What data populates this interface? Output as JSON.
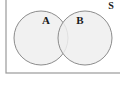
{
  "figure": {
    "type": "venn-diagram",
    "universe": {
      "label": "S",
      "label_x": 111,
      "label_y": 7,
      "rect": {
        "x": 6,
        "y": -6,
        "width": 118,
        "height": 79
      },
      "stroke": "#9a9a9a",
      "fill": "#ffffff"
    },
    "sets": [
      {
        "name": "set-a",
        "label": "A",
        "label_x": 46,
        "label_y": 21,
        "cx": 41,
        "cy": 38,
        "r": 27,
        "fill": "#efefef",
        "stroke": "#8c8c8c"
      },
      {
        "name": "set-b",
        "label": "B",
        "label_x": 80,
        "label_y": 21,
        "cx": 85,
        "cy": 38,
        "r": 27,
        "fill": "#efefef",
        "stroke": "#8c8c8c"
      }
    ],
    "colors": {
      "circle_fill": "#efefef",
      "circle_stroke": "#8c8c8c",
      "rect_stroke": "#9a9a9a",
      "label_color": "#1a1a1a",
      "background": "#ffffff"
    }
  }
}
